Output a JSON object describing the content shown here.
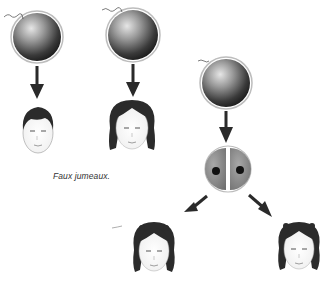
{
  "diagram": {
    "caption": "Faux jumeaux.",
    "colors": {
      "background": "#ffffff",
      "egg_dark": "#1a1a1a",
      "egg_light": "#d8d8d8",
      "egg_rim": "#bdbdbd",
      "cell_fill": "#8a8a8a",
      "nucleus": "#111111",
      "arrow": "#2a2a2a",
      "hair": "#2b2b2b"
    },
    "groups": [
      {
        "label": "fraternal",
        "nodes": [
          {
            "type": "egg",
            "id": "egg-1"
          },
          {
            "type": "child",
            "id": "boy",
            "hair": "short"
          },
          {
            "type": "egg",
            "id": "egg-2"
          },
          {
            "type": "child",
            "id": "girl-1",
            "hair": "bob"
          }
        ]
      },
      {
        "label": "identical",
        "nodes": [
          {
            "type": "egg",
            "id": "egg-3"
          },
          {
            "type": "split-cell",
            "id": "divided-egg",
            "nuclei": 2
          },
          {
            "type": "child",
            "id": "girl-2",
            "hair": "pigtails"
          },
          {
            "type": "child",
            "id": "girl-3",
            "hair": "pigtails"
          }
        ]
      }
    ]
  }
}
